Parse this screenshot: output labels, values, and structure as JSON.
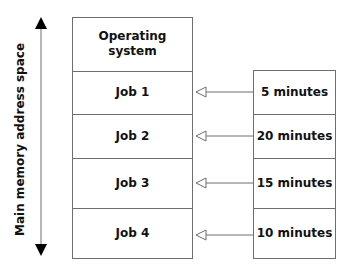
{
  "axis": {
    "label": "Main memory address space"
  },
  "memory": {
    "os_label_line1": "Operating",
    "os_label_line2": "system",
    "jobs": [
      {
        "label": "Job 1"
      },
      {
        "label": "Job 2"
      },
      {
        "label": "Job 3"
      },
      {
        "label": "Job 4"
      }
    ]
  },
  "times": [
    {
      "label": "5 minutes"
    },
    {
      "label": "20 minutes"
    },
    {
      "label": "15 minutes"
    },
    {
      "label": "10 minutes"
    }
  ],
  "colors": {
    "line": "#6e6e6e",
    "text": "#111111"
  }
}
